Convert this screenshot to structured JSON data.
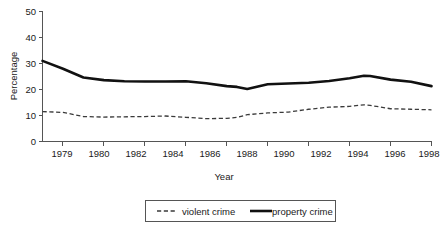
{
  "chart_data": {
    "type": "line",
    "title": "",
    "xlabel": "Year",
    "ylabel": "Percentage",
    "xlim": [
      1979,
      1998
    ],
    "ylim": [
      0,
      50
    ],
    "yticks": [
      "0",
      "10",
      "20",
      "30",
      "40",
      "50"
    ],
    "xticks": [
      "1979",
      "1980",
      "1982",
      "1984",
      "1986",
      "1988",
      "1990",
      "1992",
      "1994",
      "1996",
      "1998"
    ],
    "grid": false,
    "legend_position": "bottom",
    "x": [
      1979,
      1980,
      1981,
      1982,
      1983,
      1984,
      1985,
      1986,
      1987,
      1988,
      1988.5,
      1989,
      1990,
      1991,
      1992,
      1993,
      1994,
      1994.7,
      1995,
      1996,
      1997,
      1998
    ],
    "series": [
      {
        "name": "violent crime",
        "style": "dashed",
        "color": "#3a3a3a",
        "values": [
          11.5,
          11.2,
          9.6,
          9.4,
          9.5,
          9.6,
          9.8,
          9.3,
          8.8,
          8.9,
          9.3,
          10.3,
          11.0,
          11.3,
          12.4,
          13.2,
          13.5,
          14.1,
          13.9,
          12.6,
          12.4,
          12.2
        ]
      },
      {
        "name": "property crime",
        "style": "solid",
        "color": "#111111",
        "values": [
          31.0,
          28.0,
          24.6,
          23.6,
          23.2,
          23.1,
          23.1,
          23.2,
          22.4,
          21.3,
          21.0,
          20.2,
          22.0,
          22.3,
          22.6,
          23.3,
          24.3,
          25.3,
          25.2,
          23.8,
          23.0,
          21.3
        ]
      }
    ]
  },
  "axes": {
    "ylabel": "Percentage",
    "xlabel": "Year"
  },
  "legend": {
    "items": [
      {
        "label": "violent crime",
        "marker": "dashed-line-swatch"
      },
      {
        "label": "property crime",
        "marker": "solid-line-swatch"
      }
    ]
  },
  "yticks": [
    {
      "label": "50",
      "value": 50
    },
    {
      "label": "40",
      "value": 40
    },
    {
      "label": "30",
      "value": 30
    },
    {
      "label": "20",
      "value": 20
    },
    {
      "label": "10",
      "value": 10
    },
    {
      "label": "0",
      "value": 0
    }
  ],
  "xticks": [
    {
      "label": "1979",
      "value": 1979
    },
    {
      "label": "1980",
      "value": 1980
    },
    {
      "label": "1982",
      "value": 1982
    },
    {
      "label": "1984",
      "value": 1984
    },
    {
      "label": "1986",
      "value": 1986
    },
    {
      "label": "1988",
      "value": 1988
    },
    {
      "label": "1990",
      "value": 1990
    },
    {
      "label": "1992",
      "value": 1992
    },
    {
      "label": "1994",
      "value": 1994
    },
    {
      "label": "1996",
      "value": 1996
    },
    {
      "label": "1998",
      "value": 1998
    }
  ],
  "colors": {
    "property_crime": "#111111",
    "violent_crime": "#3a3a3a",
    "axis": "#555555",
    "background": "#ffffff"
  }
}
